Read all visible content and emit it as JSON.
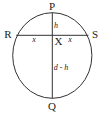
{
  "diagram": {
    "type": "circle-chord-geometry",
    "colors": {
      "stroke": "#333333",
      "text": "#222222",
      "background": "#ffffff"
    },
    "points": {
      "P": "P",
      "Q": "Q",
      "R": "R",
      "S": "S",
      "X": "X"
    },
    "segment_labels": {
      "RX": "x",
      "XS": "x",
      "PX": "h",
      "XQ": "d - h"
    }
  }
}
